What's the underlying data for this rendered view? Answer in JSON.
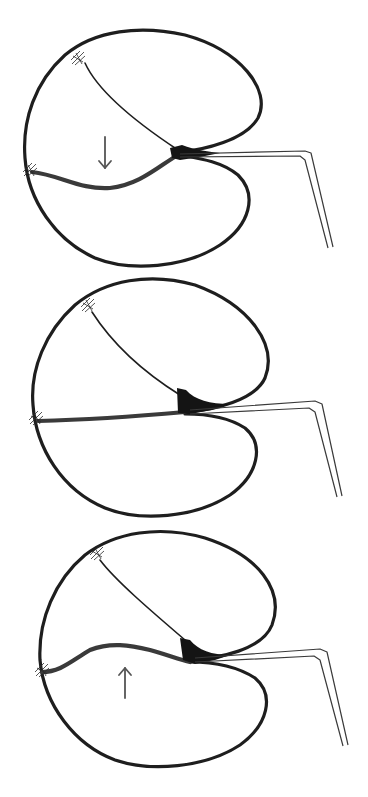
{
  "figure": {
    "description": "Three stacked schematic cross-sections of a two-lobed closing structure (resembling a valve/trap) with a thin hooked pipette on the right, showing a lower flap moving down, neutral, and moving up",
    "colors": {
      "background": "#ffffff",
      "outline": "#1e1e1e",
      "junction": "#141414",
      "moving_flap": "#3a3a3a",
      "arrow": "#555555"
    },
    "panels": [
      {
        "id": "panel-top",
        "state": "flap moving down",
        "arrow": {
          "direction": "down",
          "glyph": "↓",
          "x": 105,
          "y1": 137,
          "y2": 168
        },
        "outer": "M 178 152 C 205 150, 245 140, 258 118 C 272 90, 240 50, 185 35 C 140 25, 95 30, 65 55 C 35 82, 22 120, 25 158 C 28 200, 55 240, 95 258 C 130 272, 185 268, 220 245 C 250 225, 258 195, 238 175 C 220 160, 195 158, 178 155",
        "upper_leaflet": "M 85 63 C 95 85, 125 115, 178 150",
        "moving_leaflet": "M 32 172 C 60 175, 80 190, 110 188 C 140 185, 160 165, 178 155",
        "junction": "M 170 148 L 182 145 C 195 150, 210 152, 220 153 L 200 157 L 180 160 L 172 158 Z",
        "nexus_top": {
          "x": 78,
          "y": 58
        },
        "nexus_left": {
          "x": 30,
          "y": 170
        },
        "pipette": "M 180 154 L 305 151 L 311 153 L 333 247 M 180 157 L 300 156 L 305 160 L 328 248"
      },
      {
        "id": "panel-middle",
        "state": "flap neutral",
        "arrow": null,
        "outer": "M 185 412 C 215 410, 255 400, 265 378 C 278 345, 250 305, 195 285 C 150 272, 105 280, 75 305 C 45 332, 30 370, 33 405 C 36 448, 62 490, 105 508 C 140 522, 195 518, 230 495 C 258 475, 265 445, 245 428 C 225 415, 200 414, 185 414",
        "upper_leaflet": "M 92 312 C 110 340, 140 370, 180 395",
        "moving_leaflet": "M 38 421 C 80 420, 130 417, 185 412",
        "junction": "M 177 388 L 186 390 C 195 400, 210 404, 230 404 L 212 410 L 190 414 L 178 413 Z",
        "nexus_top": {
          "x": 88,
          "y": 305
        },
        "nexus_left": {
          "x": 36,
          "y": 418
        },
        "pipette": "M 190 410 L 315 401 L 322 404 L 342 496 M 190 414 L 309 408 L 315 412 L 337 497"
      },
      {
        "id": "panel-bottom",
        "state": "flap moving up",
        "arrow": {
          "direction": "up",
          "glyph": "↑",
          "x": 125,
          "y1": 698,
          "y2": 668
        },
        "outer": "M 190 660 C 220 658, 262 650, 272 625 C 285 590, 258 555, 205 538 C 160 525, 115 532, 85 555 C 55 580, 38 620, 40 660 C 44 705, 75 745, 115 760 C 150 772, 205 768, 240 745 C 268 725, 275 695, 255 678 C 235 665, 210 662, 190 662",
        "upper_leaflet": "M 100 560 C 115 580, 150 610, 185 640",
        "moving_leaflet": "M 42 672 C 60 672, 70 662, 90 650 C 110 642, 130 645, 150 650 C 168 655, 180 660, 190 662",
        "junction": "M 180 638 L 190 640 C 198 650, 212 655, 230 655 L 215 660 L 195 664 L 183 660 Z",
        "nexus_top": {
          "x": 97,
          "y": 553
        },
        "nexus_left": {
          "x": 42,
          "y": 670
        },
        "pipette": "M 195 658 L 320 649 L 327 652 L 348 745 M 195 662 L 314 656 L 320 660 L 343 746"
      }
    ]
  }
}
